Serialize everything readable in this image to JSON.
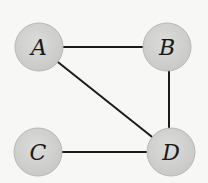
{
  "diagram": {
    "type": "undirected-graph",
    "colors": {
      "background": "#f7f7f5",
      "node_fill": "#d3d3d1",
      "node_stroke": "#b8b8b6",
      "edge": "#1a1a1a",
      "label": "#1a1a1a"
    },
    "nodes": [
      {
        "id": "A",
        "label": "A",
        "cx": 39,
        "cy": 47,
        "r": 24
      },
      {
        "id": "B",
        "label": "B",
        "cx": 167,
        "cy": 47,
        "r": 24
      },
      {
        "id": "C",
        "label": "C",
        "cx": 38,
        "cy": 152,
        "r": 24
      },
      {
        "id": "D",
        "label": "D",
        "cx": 171,
        "cy": 152,
        "r": 24
      }
    ],
    "edges": [
      {
        "from": "A",
        "to": "B"
      },
      {
        "from": "A",
        "to": "D"
      },
      {
        "from": "B",
        "to": "D"
      },
      {
        "from": "C",
        "to": "D"
      }
    ]
  }
}
